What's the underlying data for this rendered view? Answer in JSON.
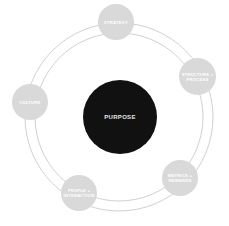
{
  "diagram": {
    "center": {
      "label": "PURPOSE",
      "fill": "#111111",
      "text_color": "#e6e6e6"
    },
    "ring": {
      "stroke": "#bdbdbd"
    },
    "nodes": [
      {
        "id": "strategy",
        "label": "STRATEGY"
      },
      {
        "id": "structure-process",
        "label": "STRUCTURE +\nPROCESS"
      },
      {
        "id": "metrics-rewards",
        "label": "METRICS +\nREWARDS"
      },
      {
        "id": "people-interaction",
        "label": "PEOPLE +\nINTERACTION"
      },
      {
        "id": "culture",
        "label": "CULTURE"
      }
    ],
    "node_fill": "#d9d9d9"
  }
}
